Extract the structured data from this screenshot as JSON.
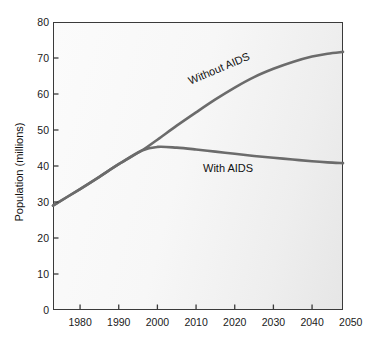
{
  "chart_data": {
    "type": "line",
    "title": "",
    "subtitle": "",
    "xlabel": "",
    "ylabel": "Population (millions)",
    "xlim": [
      1973,
      2048
    ],
    "ylim": [
      0,
      80
    ],
    "xticks": [
      1980,
      1990,
      2000,
      2010,
      2020,
      2030,
      2040,
      2050
    ],
    "yticks": [
      0,
      10,
      20,
      30,
      40,
      50,
      60,
      70,
      80
    ],
    "xtick_labels": [
      "1980",
      "1990",
      "2000",
      "2010",
      "2020",
      "2030",
      "2040",
      "2050"
    ],
    "ytick_labels": [
      "0",
      "10",
      "20",
      "30",
      "40",
      "50",
      "60",
      "70",
      "80"
    ],
    "grid": false,
    "legend": "inline-annotations",
    "line_color": "#6b6b6b",
    "frame_color": "#3a3a3a",
    "plot_background": "#f6f6f6",
    "series": [
      {
        "name": "Without AIDS",
        "annotation": "Without AIDS",
        "x": [
          1973,
          1980,
          1985,
          1990,
          1996,
          2000,
          2005,
          2010,
          2015,
          2020,
          2025,
          2030,
          2035,
          2040,
          2044,
          2048
        ],
        "values": [
          29.0,
          33.6,
          37.0,
          40.5,
          44.3,
          47.3,
          51.2,
          54.9,
          58.5,
          61.8,
          64.7,
          67.0,
          68.9,
          70.4,
          71.2,
          71.7
        ]
      },
      {
        "name": "With AIDS",
        "annotation": "With AIDS",
        "x": [
          1973,
          1980,
          1985,
          1990,
          1996,
          2000,
          2005,
          2010,
          2015,
          2020,
          2025,
          2030,
          2035,
          2040,
          2044,
          2048
        ],
        "values": [
          29.0,
          33.6,
          37.0,
          40.5,
          44.3,
          45.3,
          45.1,
          44.6,
          44.0,
          43.4,
          42.8,
          42.3,
          41.8,
          41.3,
          41.0,
          40.8
        ]
      }
    ]
  },
  "axes": {
    "y_title": "Population (millions)"
  },
  "annotations": {
    "without_aids": "Without AIDS",
    "with_aids": "With AIDS"
  }
}
